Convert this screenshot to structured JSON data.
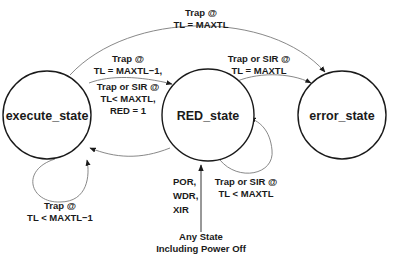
{
  "diagram": {
    "type": "state-machine",
    "states": [
      {
        "id": "execute_state",
        "label": "execute_state"
      },
      {
        "id": "RED_state",
        "label": "RED_state"
      },
      {
        "id": "error_state",
        "label": "error_state"
      }
    ],
    "transitions": [
      {
        "from": "execute_state",
        "to": "error_state",
        "label_lines": [
          "Trap @",
          "TL = MAXTL"
        ]
      },
      {
        "from": "execute_state",
        "to": "RED_state",
        "label_lines": [
          "Trap @",
          "TL = MAXTL−1,",
          "Trap or SIR @",
          "TL< MAXTL,",
          "RED = 1"
        ]
      },
      {
        "from": "RED_state",
        "to": "error_state",
        "label_lines": [
          "Trap or SIR @",
          "TL = MAXTL"
        ]
      },
      {
        "from": "RED_state",
        "to": "execute_state",
        "label_lines": [
          "DONE,",
          "RETRY,",
          "RED = 0"
        ]
      },
      {
        "from": "execute_state",
        "to": "execute_state",
        "label_lines": [
          "Trap @",
          "TL < MAXTL−1"
        ]
      },
      {
        "from": "RED_state",
        "to": "RED_state",
        "label_lines": [
          "Trap or SIR @",
          "TL < MAXTL"
        ]
      },
      {
        "from": "any",
        "to": "RED_state",
        "label_lines": [
          "POR,",
          "WDR,",
          "XIR"
        ]
      }
    ],
    "source_label_lines": [
      "Any State",
      "Including Power Off"
    ]
  },
  "labels": {
    "exec_to_error": [
      "Trap @",
      "TL = MAXTL"
    ],
    "exec_to_red": [
      "Trap @",
      "TL = MAXTL−1,",
      "Trap or SIR @",
      "TL< MAXTL,",
      "RED = 1"
    ],
    "red_to_error": [
      "Trap or SIR @",
      "TL = MAXTL"
    ],
    "red_to_exec": [
      "DONE,",
      "RETRY,",
      "RED = 0"
    ],
    "exec_self": [
      "Trap @",
      "TL < MAXTL−1"
    ],
    "red_self": [
      "Trap or SIR @",
      "TL < MAXTL"
    ],
    "reset": [
      "POR,",
      "WDR,",
      "XIR"
    ],
    "any_state": [
      "Any State",
      "Including Power Off"
    ]
  }
}
